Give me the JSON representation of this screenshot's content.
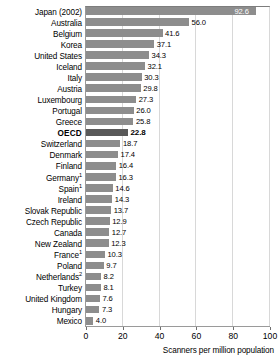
{
  "chart_data": {
    "type": "bar",
    "orientation": "horizontal",
    "title": "",
    "subtitle": "",
    "xlabel": "Scanners per million population",
    "ylabel": "",
    "xlim": [
      0,
      100
    ],
    "xticks": [
      0,
      20,
      40,
      60,
      80,
      100
    ],
    "grid": true,
    "grid_axis": "x",
    "legend": null,
    "bar_color": "#8d8d8d",
    "highlight_color": "#595959",
    "categories": [
      "Japan (2002)",
      "Australia",
      "Belgium",
      "Korea",
      "United States",
      "Iceland",
      "Italy",
      "Austria",
      "Luxembourg",
      "Portugal",
      "Greece",
      "OECD",
      "Switzerland",
      "Denmark",
      "Finland",
      "Germany",
      "Spain",
      "Ireland",
      "Slovak Republic",
      "Czech Republic",
      "Canada",
      "New Zealand",
      "France",
      "Poland",
      "Netherlands",
      "Turkey",
      "United Kingdom",
      "Hungary",
      "Mexico"
    ],
    "values": [
      92.6,
      56.0,
      41.6,
      37.1,
      34.3,
      32.1,
      30.3,
      29.8,
      27.3,
      26.0,
      25.8,
      22.8,
      18.7,
      17.4,
      16.4,
      16.3,
      14.6,
      14.3,
      13.7,
      12.9,
      12.7,
      12.3,
      10.3,
      9.7,
      8.2,
      8.1,
      7.6,
      7.3,
      4.0
    ],
    "rows": [
      {
        "label": "Japan (2002)",
        "footnote": "",
        "value": 92.6,
        "value_text": "92.6",
        "highlight": false,
        "label_inside": true
      },
      {
        "label": "Australia",
        "footnote": "",
        "value": 56.0,
        "value_text": "56.0",
        "highlight": false,
        "label_inside": false
      },
      {
        "label": "Belgium",
        "footnote": "",
        "value": 41.6,
        "value_text": "41.6",
        "highlight": false,
        "label_inside": false
      },
      {
        "label": "Korea",
        "footnote": "",
        "value": 37.1,
        "value_text": "37.1",
        "highlight": false,
        "label_inside": false
      },
      {
        "label": "United States",
        "footnote": "",
        "value": 34.3,
        "value_text": "34.3",
        "highlight": false,
        "label_inside": false
      },
      {
        "label": "Iceland",
        "footnote": "",
        "value": 32.1,
        "value_text": "32.1",
        "highlight": false,
        "label_inside": false
      },
      {
        "label": "Italy",
        "footnote": "",
        "value": 30.3,
        "value_text": "30.3",
        "highlight": false,
        "label_inside": false
      },
      {
        "label": "Austria",
        "footnote": "",
        "value": 29.8,
        "value_text": "29.8",
        "highlight": false,
        "label_inside": false
      },
      {
        "label": "Luxembourg",
        "footnote": "",
        "value": 27.3,
        "value_text": "27.3",
        "highlight": false,
        "label_inside": false
      },
      {
        "label": "Portugal",
        "footnote": "",
        "value": 26.0,
        "value_text": "26.0",
        "highlight": false,
        "label_inside": false
      },
      {
        "label": "Greece",
        "footnote": "",
        "value": 25.8,
        "value_text": "25.8",
        "highlight": false,
        "label_inside": false
      },
      {
        "label": "OECD",
        "footnote": "",
        "value": 22.8,
        "value_text": "22.8",
        "highlight": true,
        "label_inside": false
      },
      {
        "label": "Switzerland",
        "footnote": "",
        "value": 18.7,
        "value_text": "18.7",
        "highlight": false,
        "label_inside": false
      },
      {
        "label": "Denmark",
        "footnote": "",
        "value": 17.4,
        "value_text": "17.4",
        "highlight": false,
        "label_inside": false
      },
      {
        "label": "Finland",
        "footnote": "",
        "value": 16.4,
        "value_text": "16.4",
        "highlight": false,
        "label_inside": false
      },
      {
        "label": "Germany",
        "footnote": "1",
        "value": 16.3,
        "value_text": "16.3",
        "highlight": false,
        "label_inside": false
      },
      {
        "label": "Spain",
        "footnote": "1",
        "value": 14.6,
        "value_text": "14.6",
        "highlight": false,
        "label_inside": false
      },
      {
        "label": "Ireland",
        "footnote": "",
        "value": 14.3,
        "value_text": "14.3",
        "highlight": false,
        "label_inside": false
      },
      {
        "label": "Slovak Republic",
        "footnote": "",
        "value": 13.7,
        "value_text": "13.7",
        "highlight": false,
        "label_inside": false
      },
      {
        "label": "Czech Republic",
        "footnote": "",
        "value": 12.9,
        "value_text": "12.9",
        "highlight": false,
        "label_inside": false
      },
      {
        "label": "Canada",
        "footnote": "",
        "value": 12.7,
        "value_text": "12.7",
        "highlight": false,
        "label_inside": false
      },
      {
        "label": "New Zealand",
        "footnote": "",
        "value": 12.3,
        "value_text": "12.3",
        "highlight": false,
        "label_inside": false
      },
      {
        "label": "France",
        "footnote": "1",
        "value": 10.3,
        "value_text": "10.3",
        "highlight": false,
        "label_inside": false
      },
      {
        "label": "Poland",
        "footnote": "",
        "value": 9.7,
        "value_text": "9.7",
        "highlight": false,
        "label_inside": false
      },
      {
        "label": "Netherlands",
        "footnote": "2",
        "value": 8.2,
        "value_text": "8.2",
        "highlight": false,
        "label_inside": false
      },
      {
        "label": "Turkey",
        "footnote": "",
        "value": 8.1,
        "value_text": "8.1",
        "highlight": false,
        "label_inside": false
      },
      {
        "label": "United Kingdom",
        "footnote": "",
        "value": 7.6,
        "value_text": "7.6",
        "highlight": false,
        "label_inside": false
      },
      {
        "label": "Hungary",
        "footnote": "",
        "value": 7.3,
        "value_text": "7.3",
        "highlight": false,
        "label_inside": false
      },
      {
        "label": "Mexico",
        "footnote": "",
        "value": 4.0,
        "value_text": "4.0",
        "highlight": false,
        "label_inside": false
      }
    ]
  }
}
